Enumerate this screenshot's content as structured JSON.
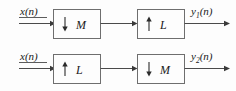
{
  "figure": {
    "background_color": "#fdfdfd",
    "line_color": "#4a4a4a",
    "box_fill": "#fdfdfd",
    "box_stroke": "#6e6e6e",
    "text_color": "#1a1a1a"
  },
  "rows": [
    {
      "id": "row-1",
      "input_label": "x(n)",
      "output_label_base": "y",
      "output_label_sub": "1",
      "output_label_suffix": "(n)",
      "output_label_full": "y1(n)",
      "blocks": [
        {
          "id": "block-decimator-m",
          "icon": "down-arrow-icon",
          "direction": "down",
          "factor": "M"
        },
        {
          "id": "block-interpolator-l",
          "icon": "up-arrow-icon",
          "direction": "up",
          "factor": "L"
        }
      ]
    },
    {
      "id": "row-2",
      "input_label": "x(n)",
      "output_label_base": "y",
      "output_label_sub": "2",
      "output_label_suffix": "(n)",
      "output_label_full": "y2(n)",
      "blocks": [
        {
          "id": "block-interpolator-l",
          "icon": "up-arrow-icon",
          "direction": "up",
          "factor": "L"
        },
        {
          "id": "block-decimator-m",
          "icon": "down-arrow-icon",
          "direction": "down",
          "factor": "M"
        }
      ]
    }
  ]
}
